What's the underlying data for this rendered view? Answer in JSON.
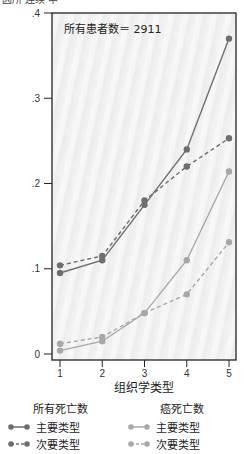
{
  "header": {
    "cut_text": "因所 连续 中"
  },
  "chart_data": {
    "type": "line",
    "title": "",
    "annotation": "所有患者数＝ 2911",
    "xlabel": "组织学类型",
    "ylabel": "",
    "categories": [
      1,
      2,
      3,
      4,
      5
    ],
    "x_ticks": [
      "1",
      "2",
      "3",
      "4",
      "5"
    ],
    "y_ticks": [
      "0",
      ".1",
      ".2",
      ".3",
      ".4"
    ],
    "ylim": [
      0,
      0.4
    ],
    "grid": false,
    "legend_position": "bottom",
    "series": [
      {
        "name": "所有死亡数 - 主要类型",
        "group": "所有死亡数",
        "label": "主要类型",
        "style": "solid",
        "color": "#6e6e6e",
        "values": [
          0.095,
          0.11,
          0.175,
          0.24,
          0.37
        ]
      },
      {
        "name": "所有死亡数 - 次要类型",
        "group": "所有死亡数",
        "label": "次要类型",
        "style": "dashed",
        "color": "#6e6e6e",
        "values": [
          0.104,
          0.115,
          0.18,
          0.22,
          0.253
        ]
      },
      {
        "name": "癌死亡数 - 主要类型",
        "group": "癌死亡数",
        "label": "主要类型",
        "style": "solid",
        "color": "#a8a8a8",
        "values": [
          0.004,
          0.015,
          0.048,
          0.11,
          0.214
        ]
      },
      {
        "name": "癌死亡数 - 次要类型",
        "group": "癌死亡数",
        "label": "次要类型",
        "style": "dashed",
        "color": "#a8a8a8",
        "values": [
          0.012,
          0.02,
          0.048,
          0.07,
          0.131
        ]
      }
    ]
  },
  "legend": {
    "groups": [
      {
        "title": "所有死亡数",
        "items": [
          {
            "label": "主要类型"
          },
          {
            "label": "次要类型"
          }
        ]
      },
      {
        "title": "癌死亡数",
        "items": [
          {
            "label": "主要类型"
          },
          {
            "label": "次要类型"
          }
        ]
      }
    ]
  }
}
